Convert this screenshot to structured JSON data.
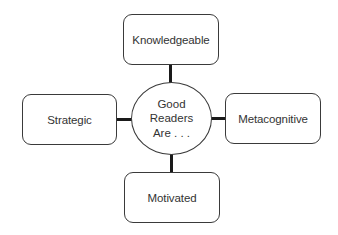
{
  "diagram": {
    "type": "concept-map",
    "center": {
      "lines": [
        "Good",
        "Readers",
        "Are . . ."
      ]
    },
    "nodes": {
      "top": {
        "label": "Knowledgeable"
      },
      "left": {
        "label": "Strategic"
      },
      "right": {
        "label": "Metacognitive"
      },
      "bottom": {
        "label": "Motivated"
      }
    },
    "colors": {
      "border": "#3a3a3a",
      "connector": "#1a1a1a",
      "text": "#333333",
      "background": "#ffffff"
    }
  }
}
